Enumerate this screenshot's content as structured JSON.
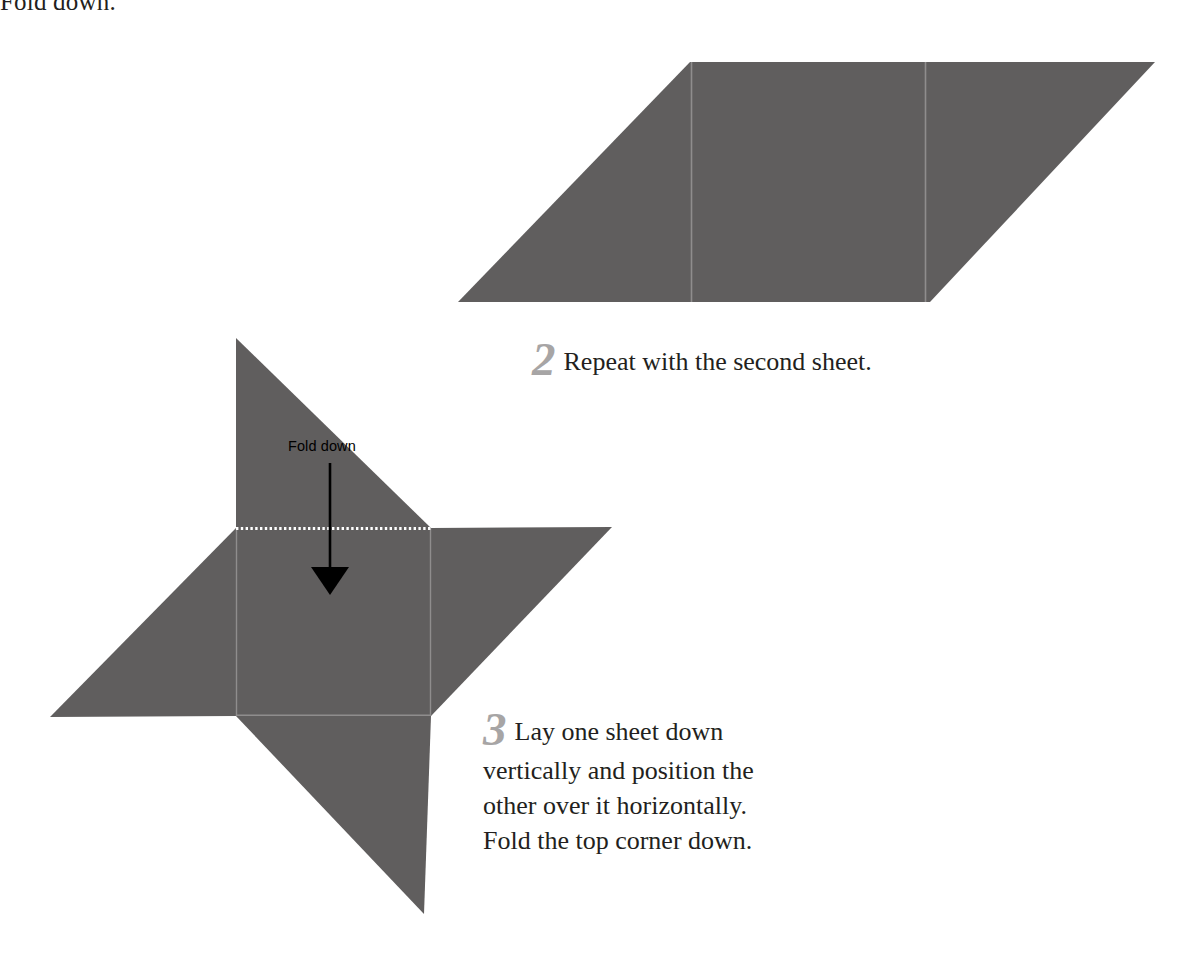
{
  "page": {
    "background_color": "#ffffff",
    "width": 1198,
    "height": 953,
    "paper_fill_color": "#605e5e",
    "fold_line_color": "#ffffff",
    "crease_line_color": "#8e8c8c",
    "step_number_color": "#a7a5a5",
    "text_color": "#231f20"
  },
  "clipped_top_caption": {
    "text": "Fold down."
  },
  "steps": [
    {
      "number": "2",
      "text": "Repeat with the second sheet."
    },
    {
      "number": "3",
      "lines": [
        "Lay one sheet down",
        "vertically and position the",
        "other over it horizontally.",
        "Fold the top corner down."
      ],
      "text": "Lay one sheet down vertically and position the other over it horizontally. Fold the top corner down."
    }
  ],
  "annotations": {
    "fold_down_label": "Fold down",
    "arrow_direction": "down"
  },
  "figures": {
    "parallelogram": {
      "name": "folded-sheet-parallelogram",
      "outline_points": "690,62 1155,62 930,302 458,302",
      "crease_left": "691,62 691,302",
      "crease_right": "925,62 925,302"
    },
    "pinwheel": {
      "name": "layered-sheets-pinwheel",
      "square": "236,528 431,528 431,716 236,716",
      "point_top": "236,338 431,528 236,528",
      "point_right": "612,527 431,716 431,528",
      "point_left": "50,717 236,528 236,716",
      "point_bottom": "424,914 236,716 431,716",
      "fold_dashed_line": "236,528 431,528",
      "arrow_shaft": "330,464 330,570",
      "arrow_head": "313,568 347,568 330,594"
    }
  }
}
